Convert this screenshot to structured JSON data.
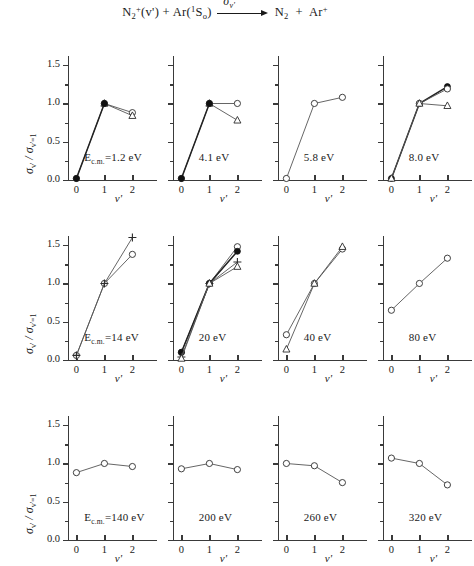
{
  "figure": {
    "reaction": {
      "reactant1": "N",
      "reactant1_sub": "2",
      "reactant1_sup": "+",
      "reactant1_state": "(v')",
      "plus1": "+",
      "reactant2": "Ar",
      "reactant2_state_pre": "(",
      "reactant2_state_sup": "1",
      "reactant2_state_mid": "S",
      "reactant2_state_sub": "o",
      "reactant2_state_post": ")",
      "arrow_label_sigma": "σ",
      "arrow_label_sub": "v'",
      "product1": "N",
      "product1_sub": "2",
      "plus2": "+",
      "product2": "Ar",
      "product2_sup": "+"
    },
    "axis": {
      "y_title_sigma": "σ",
      "y_title_sub1": "v'",
      "y_title_slash": " / ",
      "y_title_sigma2": "σ",
      "y_title_sub2": "v'=1",
      "x_title": "v'",
      "y_ticks": [
        "0.0",
        "0.5",
        "1.0",
        "1.5"
      ],
      "y_tick_values": [
        0.0,
        0.5,
        1.0,
        1.5
      ],
      "y_minor_values": [
        0.25,
        0.75,
        1.25
      ],
      "x_ticks": [
        "0",
        "1",
        "2"
      ],
      "x_tick_values": [
        0,
        1,
        2
      ],
      "ylim": [
        0.0,
        1.62
      ],
      "xlim": [
        -0.3,
        2.45
      ]
    },
    "colors": {
      "axis": "#3a3a3a",
      "line": "#555555",
      "marker_open": "#ffffff",
      "marker_stroke": "#2b2b2b",
      "marker_filled": "#111111",
      "text": "#1a1a1a"
    }
  },
  "chart_data": {
    "type": "line",
    "xlabel": "v'",
    "ylabel": "σv' / σv'=1",
    "xlim": [
      -0.3,
      2.45
    ],
    "ylim": [
      0.0,
      1.62
    ],
    "x_ticks": [
      0,
      1,
      2
    ],
    "y_ticks": [
      0.0,
      0.5,
      1.0,
      1.5
    ],
    "grid": false,
    "legend": "none",
    "panel_grid": {
      "rows": 3,
      "cols": 4
    },
    "panels": [
      {
        "id": "p1",
        "row": 0,
        "col": 0,
        "label_prefix": "E",
        "label_sub": "c.m.",
        "label": "E_c.m=1.2 eV",
        "label_text": "=1.2 eV",
        "energy": "1.2 eV",
        "show_y_axis_labels": true,
        "series": [
          {
            "name": "open-circle",
            "marker": "circle-open",
            "x": [
              0,
              1,
              2
            ],
            "values": [
              0.02,
              1.0,
              0.88
            ]
          },
          {
            "name": "triangle-open",
            "marker": "triangle-open",
            "x": [
              1,
              2
            ],
            "values": [
              1.0,
              0.84
            ]
          },
          {
            "name": "filled-circle",
            "marker": "circle-filled",
            "x": [
              0,
              1
            ],
            "values": [
              0.02,
              1.0
            ]
          }
        ]
      },
      {
        "id": "p2",
        "row": 0,
        "col": 1,
        "label": "4.1 eV",
        "label_text": "4.1 eV",
        "energy": "4.1 eV",
        "show_y_axis_labels": false,
        "series": [
          {
            "name": "open-circle",
            "marker": "circle-open",
            "x": [
              0,
              1,
              2
            ],
            "values": [
              0.02,
              1.0,
              1.0
            ]
          },
          {
            "name": "triangle-open",
            "marker": "triangle-open",
            "x": [
              1,
              2
            ],
            "values": [
              1.0,
              0.78
            ]
          },
          {
            "name": "filled-circle",
            "marker": "circle-filled",
            "x": [
              0,
              1
            ],
            "values": [
              0.02,
              1.0
            ]
          }
        ]
      },
      {
        "id": "p3",
        "row": 0,
        "col": 2,
        "label": "5.8 eV",
        "label_text": "5.8 eV",
        "energy": "5.8 eV",
        "show_y_axis_labels": false,
        "series": [
          {
            "name": "open-circle",
            "marker": "circle-open",
            "x": [
              0,
              1,
              2
            ],
            "values": [
              0.02,
              1.0,
              1.08
            ]
          }
        ]
      },
      {
        "id": "p4",
        "row": 0,
        "col": 3,
        "label": "8.0 eV",
        "label_text": "8.0 eV",
        "energy": "8.0 eV",
        "show_y_axis_labels": false,
        "series": [
          {
            "name": "filled-circle",
            "marker": "circle-filled",
            "x": [
              0,
              1,
              2
            ],
            "values": [
              0.02,
              1.0,
              1.22
            ]
          },
          {
            "name": "open-circle",
            "marker": "circle-open",
            "x": [
              1,
              2
            ],
            "values": [
              1.0,
              1.19
            ]
          },
          {
            "name": "triangle-open",
            "marker": "triangle-open",
            "x": [
              0,
              1,
              2
            ],
            "values": [
              0.02,
              1.0,
              0.97
            ]
          }
        ]
      },
      {
        "id": "p5",
        "row": 1,
        "col": 0,
        "label_prefix": "E",
        "label_sub": "c.m.",
        "label": "E_c.m=14 eV",
        "label_text": "=14 eV",
        "energy": "14 eV",
        "show_y_axis_labels": true,
        "series": [
          {
            "name": "open-circle",
            "marker": "circle-open",
            "x": [
              0,
              1,
              2
            ],
            "values": [
              0.06,
              1.0,
              1.38
            ]
          },
          {
            "name": "plus",
            "marker": "plus",
            "x": [
              0,
              1,
              2
            ],
            "values": [
              0.06,
              1.0,
              1.6
            ]
          }
        ]
      },
      {
        "id": "p6",
        "row": 1,
        "col": 1,
        "label": "20 eV",
        "label_text": "20 eV",
        "energy": "20 eV",
        "show_y_axis_labels": false,
        "series": [
          {
            "name": "open-circle",
            "marker": "circle-open",
            "x": [
              0,
              1,
              2
            ],
            "values": [
              0.1,
              1.0,
              1.48
            ]
          },
          {
            "name": "filled-circle",
            "marker": "circle-filled",
            "x": [
              0,
              1,
              2
            ],
            "values": [
              0.1,
              1.0,
              1.42
            ]
          },
          {
            "name": "plus",
            "marker": "plus",
            "x": [
              0,
              1,
              2
            ],
            "values": [
              0.04,
              1.0,
              1.28
            ]
          },
          {
            "name": "triangle-open",
            "marker": "triangle-open",
            "x": [
              0,
              1,
              2
            ],
            "values": [
              0.02,
              1.0,
              1.22
            ]
          }
        ]
      },
      {
        "id": "p7",
        "row": 1,
        "col": 2,
        "label": "40 eV",
        "label_text": "40 eV",
        "energy": "40 eV",
        "show_y_axis_labels": false,
        "series": [
          {
            "name": "open-circle",
            "marker": "circle-open",
            "x": [
              0,
              1,
              2
            ],
            "values": [
              0.33,
              1.0,
              1.45
            ]
          },
          {
            "name": "triangle-open",
            "marker": "triangle-open",
            "x": [
              0,
              1,
              2
            ],
            "values": [
              0.14,
              1.0,
              1.48
            ]
          }
        ]
      },
      {
        "id": "p8",
        "row": 1,
        "col": 3,
        "label": "80 eV",
        "label_text": "80 eV",
        "energy": "80 eV",
        "show_y_axis_labels": false,
        "series": [
          {
            "name": "open-circle",
            "marker": "circle-open",
            "x": [
              0,
              1,
              2
            ],
            "values": [
              0.65,
              1.0,
              1.33
            ]
          }
        ]
      },
      {
        "id": "p9",
        "row": 2,
        "col": 0,
        "label_prefix": "E",
        "label_sub": "c.m.",
        "label": "E_c.m=140 eV",
        "label_text": "=140 eV",
        "energy": "140 eV",
        "show_y_axis_labels": true,
        "series": [
          {
            "name": "open-circle",
            "marker": "circle-open",
            "x": [
              0,
              1,
              2
            ],
            "values": [
              0.88,
              1.0,
              0.96
            ]
          }
        ]
      },
      {
        "id": "p10",
        "row": 2,
        "col": 1,
        "label": "200 eV",
        "label_text": "200 eV",
        "energy": "200 eV",
        "show_y_axis_labels": false,
        "series": [
          {
            "name": "open-circle",
            "marker": "circle-open",
            "x": [
              0,
              1,
              2
            ],
            "values": [
              0.93,
              1.0,
              0.92
            ]
          }
        ]
      },
      {
        "id": "p11",
        "row": 2,
        "col": 2,
        "label": "260 eV",
        "label_text": "260 eV",
        "energy": "260 eV",
        "show_y_axis_labels": false,
        "series": [
          {
            "name": "open-circle",
            "marker": "circle-open",
            "x": [
              0,
              1,
              2
            ],
            "values": [
              1.0,
              0.97,
              0.75
            ]
          }
        ]
      },
      {
        "id": "p12",
        "row": 2,
        "col": 3,
        "label": "320 eV",
        "label_text": "320 eV",
        "energy": "320 eV",
        "show_y_axis_labels": false,
        "series": [
          {
            "name": "open-circle",
            "marker": "circle-open",
            "x": [
              0,
              1,
              2
            ],
            "values": [
              1.07,
              1.0,
              0.72
            ]
          }
        ]
      }
    ]
  }
}
